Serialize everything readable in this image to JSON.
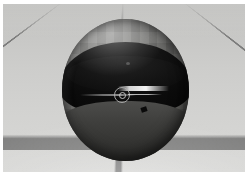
{
  "app": {
    "title": "3D Viewport",
    "render_label": "Perspective",
    "scene_name": "Reflective Sphere on Grid Floor"
  },
  "viewport": {
    "name": "perspective-viewport",
    "background_color": "#c9c9c7",
    "floor": {
      "name": "grid-floor",
      "base_color": "#d2d2d0",
      "line_color": "#5f5f5f",
      "grid_visible": true
    },
    "horizon_label": "",
    "objects": [
      {
        "name": "sphere",
        "label": "Sphere",
        "selected": true,
        "material": "reflective-chrome",
        "shell_color": "#7d7d7b",
        "reflection_color": "#0b0b0b",
        "lower_band_color": "#3f3f3d",
        "highlight_color": "#ffffff"
      }
    ],
    "gizmo": {
      "name": "transform-gizmo",
      "visible": true,
      "axis_color": "#d7d7d7",
      "ring_color": "#afafaf"
    }
  }
}
